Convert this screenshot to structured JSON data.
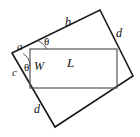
{
  "figure": {
    "type": "geometry-diagram",
    "background_color": "#ffffff",
    "stroke_color": "#1a1a1a",
    "inner_stroke_color": "#555555",
    "outer_quad": {
      "name": "outer-quadrilateral",
      "vertices": [
        {
          "id": "left",
          "x": 12,
          "y": 53
        },
        {
          "id": "top",
          "x": 100,
          "y": 10
        },
        {
          "id": "right",
          "x": 133,
          "y": 76
        },
        {
          "id": "bottom",
          "x": 55,
          "y": 127
        }
      ],
      "points_attr": "12,53 100,10 133,76 55,127"
    },
    "inner_rect": {
      "name": "inner-rectangle",
      "x": 30,
      "y": 49,
      "width": 87,
      "height": 39
    },
    "angle_arcs": [
      {
        "id": "theta-top",
        "path": "M 47 49 A 17 17 0 0 0 38.5 41.0"
      },
      {
        "id": "theta-left",
        "path": "M 30 66 A 15 15 0 0 0 23.0 53.5"
      }
    ],
    "labels": {
      "side_b": "b",
      "side_d_top": "d",
      "side_d_bottom": "d",
      "side_a": "a",
      "side_c": "c",
      "length_L": "L",
      "width_W": "W",
      "theta_top": "θ",
      "theta_left": "θ"
    },
    "label_positions": {
      "side_b": {
        "left": 65,
        "top": 16
      },
      "side_d_top": {
        "left": 116,
        "top": 27
      },
      "side_d_bottom": {
        "left": 34,
        "top": 103
      },
      "side_a": {
        "left": 17,
        "top": 41
      },
      "side_c": {
        "left": 12,
        "top": 67
      },
      "length_L": {
        "left": 67,
        "top": 56
      },
      "width_W": {
        "left": 34,
        "top": 60
      },
      "theta_top": {
        "left": 44,
        "top": 36
      },
      "theta_left": {
        "left": 24,
        "top": 62
      }
    }
  }
}
